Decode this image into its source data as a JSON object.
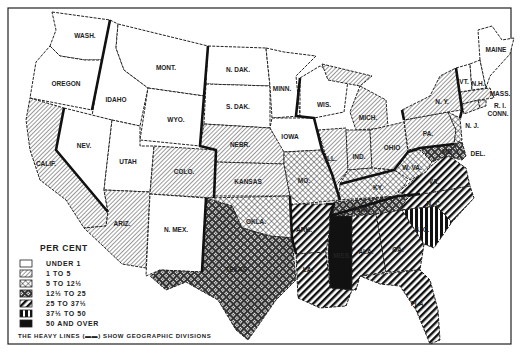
{
  "legend": {
    "title": "PER CENT",
    "items": [
      {
        "key": "c0",
        "label": "UNDER 1",
        "pattern": "blank"
      },
      {
        "key": "c1",
        "label": "1 TO 5",
        "pattern": "fine-diagonal"
      },
      {
        "key": "c2",
        "label": "5 TO 12½",
        "pattern": "crosshatch"
      },
      {
        "key": "c3",
        "label": "12½ TO 25",
        "pattern": "dense-dot-grid"
      },
      {
        "key": "c4",
        "label": "25 TO 37½",
        "pattern": "heavy-diagonal"
      },
      {
        "key": "c5",
        "label": "37½ TO 50",
        "pattern": "vertical-bars"
      },
      {
        "key": "c6",
        "label": "50 AND OVER",
        "pattern": "solid-black"
      }
    ],
    "note": "THE HEAVY LINES (▬▬) SHOW GEOGRAPHIC DIVISIONS"
  },
  "states": [
    {
      "abbr": "WASH.",
      "class": "UNDER 1"
    },
    {
      "abbr": "OREGON",
      "class": "UNDER 1"
    },
    {
      "abbr": "CALIF.",
      "class": "1 TO 5"
    },
    {
      "abbr": "IDAHO",
      "class": "UNDER 1"
    },
    {
      "abbr": "NEV.",
      "class": "UNDER 1"
    },
    {
      "abbr": "UTAH",
      "class": "UNDER 1"
    },
    {
      "abbr": "ARIZ.",
      "class": "1 TO 5"
    },
    {
      "abbr": "MONT.",
      "class": "UNDER 1"
    },
    {
      "abbr": "WYO.",
      "class": "UNDER 1"
    },
    {
      "abbr": "COLO.",
      "class": "1 TO 5"
    },
    {
      "abbr": "N. MEX.",
      "class": "UNDER 1"
    },
    {
      "abbr": "N. DAK.",
      "class": "UNDER 1"
    },
    {
      "abbr": "S. DAK.",
      "class": "UNDER 1"
    },
    {
      "abbr": "NEBR.",
      "class": "1 TO 5"
    },
    {
      "abbr": "KANSAS",
      "class": "1 TO 5"
    },
    {
      "abbr": "OKLA.",
      "class": "5 TO 12½"
    },
    {
      "abbr": "TEXAS",
      "class": "12½ TO 25"
    },
    {
      "abbr": "MINN.",
      "class": "UNDER 1"
    },
    {
      "abbr": "IOWA",
      "class": "UNDER 1"
    },
    {
      "abbr": "MO.",
      "class": "5 TO 12½"
    },
    {
      "abbr": "ARK.",
      "class": "25 TO 37½"
    },
    {
      "abbr": "LA.",
      "class": "25 TO 37½"
    },
    {
      "abbr": "WIS.",
      "class": "UNDER 1"
    },
    {
      "abbr": "ILL.",
      "class": "1 TO 5"
    },
    {
      "abbr": "MICH.",
      "class": "1 TO 5"
    },
    {
      "abbr": "IND.",
      "class": "1 TO 5"
    },
    {
      "abbr": "OHIO",
      "class": "1 TO 5"
    },
    {
      "abbr": "KY.",
      "class": "5 TO 12½"
    },
    {
      "abbr": "TENN.",
      "class": "12½ TO 25"
    },
    {
      "abbr": "MISS.",
      "class": "50 AND OVER"
    },
    {
      "abbr": "ALA.",
      "class": "25 TO 37½"
    },
    {
      "abbr": "GA.",
      "class": "25 TO 37½"
    },
    {
      "abbr": "FLA.",
      "class": "25 TO 37½"
    },
    {
      "abbr": "S. C.",
      "class": "37½ TO 50"
    },
    {
      "abbr": "N. C.",
      "class": "25 TO 37½"
    },
    {
      "abbr": "VA.",
      "class": "25 TO 37½"
    },
    {
      "abbr": "W. VA.",
      "class": "5 TO 12½"
    },
    {
      "abbr": "MD.",
      "class": "12½ TO 25"
    },
    {
      "abbr": "DEL.",
      "class": "12½ TO 25"
    },
    {
      "abbr": "PA.",
      "class": "1 TO 5"
    },
    {
      "abbr": "N. J.",
      "class": "1 TO 5"
    },
    {
      "abbr": "N. Y.",
      "class": "1 TO 5"
    },
    {
      "abbr": "CONN.",
      "class": "1 TO 5"
    },
    {
      "abbr": "R. I.",
      "class": "1 TO 5"
    },
    {
      "abbr": "MASS.",
      "class": "1 TO 5"
    },
    {
      "abbr": "VT.",
      "class": "UNDER 1"
    },
    {
      "abbr": "N.H.",
      "class": "UNDER 1"
    },
    {
      "abbr": "MAINE",
      "class": "UNDER 1"
    }
  ],
  "labels": {
    "wash": "WASH.",
    "oregon": "OREGON",
    "calif": "CALIF.",
    "idaho": "IDAHO",
    "nev": "NEV.",
    "utah": "UTAH",
    "ariz": "ARIZ.",
    "mont": "MONT.",
    "wyo": "WYO.",
    "colo": "COLO.",
    "nmex": "N. MEX.",
    "ndak": "N. DAK.",
    "sdak": "S. DAK.",
    "nebr": "NEBR.",
    "kansas": "KANSAS",
    "okla": "OKLA.",
    "texas": "TEXAS",
    "minn": "MINN.",
    "iowa": "IOWA",
    "mo": "MO.",
    "ark": "ARK.",
    "la": "LA.",
    "wis": "WIS.",
    "ill": "ILL.",
    "mich": "MICH.",
    "ind": "IND.",
    "ohio": "OHIO",
    "ky": "KY.",
    "tenn": "TENN.",
    "miss": "MISS.",
    "ala": "ALA.",
    "ga": "GA.",
    "fla": "FLA.",
    "sc": "S. C.",
    "nc": "N. C.",
    "va": "VA.",
    "wva": "W. VA.",
    "md": "MD.",
    "del": "DEL.",
    "pa": "PA.",
    "nj": "N. J.",
    "ny": "N. Y.",
    "conn": "CONN.",
    "ri": "R. I.",
    "mass": "MASS.",
    "vt": "VT.",
    "nh": "N.H.",
    "maine": "MAINE"
  }
}
